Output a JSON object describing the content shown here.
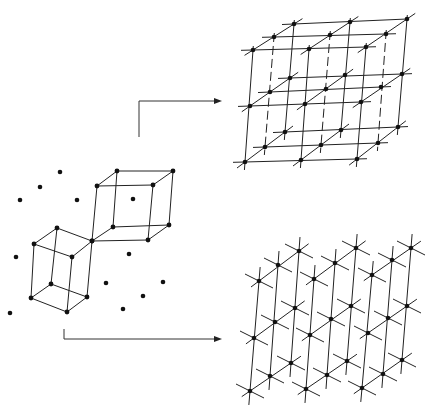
{
  "figure": {
    "colors": {
      "line": "#222222",
      "point": "#111111",
      "background": "#ffffff"
    }
  },
  "scatter_points": [
    [
      20,
      200
    ],
    [
      40,
      187
    ],
    [
      60,
      172
    ],
    [
      77,
      200
    ],
    [
      133,
      199
    ],
    [
      16,
      257
    ],
    [
      129,
      254
    ],
    [
      106,
      283
    ],
    [
      163,
      282
    ],
    [
      143,
      296
    ],
    [
      123,
      309
    ],
    [
      10,
      313
    ]
  ],
  "lower_cell": {
    "vertices": [
      [
        57,
        228
      ],
      [
        34,
        244
      ],
      [
        72,
        257
      ],
      [
        92,
        241
      ],
      [
        51,
        284
      ],
      [
        31,
        298
      ],
      [
        67,
        312
      ],
      [
        87,
        297
      ]
    ],
    "edges": [
      [
        0,
        1
      ],
      [
        1,
        2
      ],
      [
        2,
        3
      ],
      [
        3,
        0
      ],
      [
        4,
        5
      ],
      [
        5,
        6
      ],
      [
        6,
        7
      ],
      [
        7,
        4
      ],
      [
        0,
        4
      ],
      [
        1,
        5
      ],
      [
        2,
        6
      ],
      [
        3,
        7
      ]
    ]
  },
  "upper_cell": {
    "vertices": [
      [
        97,
        186
      ],
      [
        117,
        171
      ],
      [
        173,
        171
      ],
      [
        153,
        185
      ],
      [
        92,
        241
      ],
      [
        113,
        227
      ],
      [
        169,
        225
      ],
      [
        148,
        240
      ]
    ],
    "edges": [
      [
        0,
        1
      ],
      [
        1,
        2
      ],
      [
        2,
        3
      ],
      [
        3,
        0
      ],
      [
        4,
        5
      ],
      [
        5,
        6
      ],
      [
        6,
        7
      ],
      [
        7,
        4
      ],
      [
        0,
        4
      ],
      [
        1,
        5
      ],
      [
        2,
        6
      ],
      [
        3,
        7
      ]
    ]
  },
  "arrows": [
    {
      "name": "arrow-to-top-lattice",
      "points": [
        [
          139,
          137
        ],
        [
          139,
          101
        ],
        [
          216,
          101
        ]
      ],
      "head": [
        222,
        101
      ]
    },
    {
      "name": "arrow-to-bottom-lattice",
      "points": [
        [
          64,
          329
        ],
        [
          64,
          339
        ],
        [
          216,
          339
        ]
      ],
      "head": [
        222,
        339
      ]
    }
  ],
  "top_lattice": {
    "grid": [
      [
        [
          [
            253,
            50
          ],
          [
            309,
            49
          ],
          [
            366,
            47
          ]
        ],
        [
          [
            274,
            37
          ],
          [
            330,
            35
          ],
          [
            386,
            34
          ]
        ],
        [
          [
            294,
            24
          ],
          [
            350,
            22
          ],
          [
            407,
            19
          ]
        ]
      ],
      [
        [
          [
            250,
            106
          ],
          [
            305,
            104
          ],
          [
            361,
            102
          ]
        ],
        [
          [
            270,
            92
          ],
          [
            326,
            89
          ],
          [
            381,
            87
          ]
        ],
        [
          [
            290,
            78
          ],
          [
            345,
            75
          ],
          [
            402,
            74
          ]
        ]
      ],
      [
        [
          [
            245,
            162
          ],
          [
            301,
            160
          ],
          [
            357,
            159
          ]
        ],
        [
          [
            265,
            147
          ],
          [
            321,
            145
          ],
          [
            378,
            143
          ]
        ],
        [
          [
            285,
            132
          ],
          [
            341,
            130
          ],
          [
            398,
            127
          ]
        ]
      ]
    ]
  },
  "bottom_lattice": {
    "grid": [
      [
        [
          [
            259,
            281
          ],
          [
            278,
            265
          ],
          [
            299,
            251
          ]
        ],
        [
          [
            314,
            279
          ],
          [
            335,
            263
          ],
          [
            356,
            248
          ]
        ],
        [
          [
            372,
            275
          ],
          [
            392,
            260
          ],
          [
            411,
            248
          ]
        ]
      ],
      [
        [
          [
            254,
            338
          ],
          [
            275,
            322
          ],
          [
            295,
            308
          ]
        ],
        [
          [
            310,
            335
          ],
          [
            331,
            319
          ],
          [
            351,
            306
          ]
        ],
        [
          [
            368,
            333
          ],
          [
            388,
            318
          ],
          [
            407,
            306
          ]
        ]
      ],
      [
        [
          [
            250,
            391
          ],
          [
            270,
            376
          ],
          [
            291,
            363
          ]
        ],
        [
          [
            306,
            389
          ],
          [
            327,
            375
          ],
          [
            347,
            361
          ]
        ],
        [
          [
            362,
            388
          ],
          [
            383,
            374
          ],
          [
            402,
            360
          ]
        ]
      ]
    ]
  }
}
